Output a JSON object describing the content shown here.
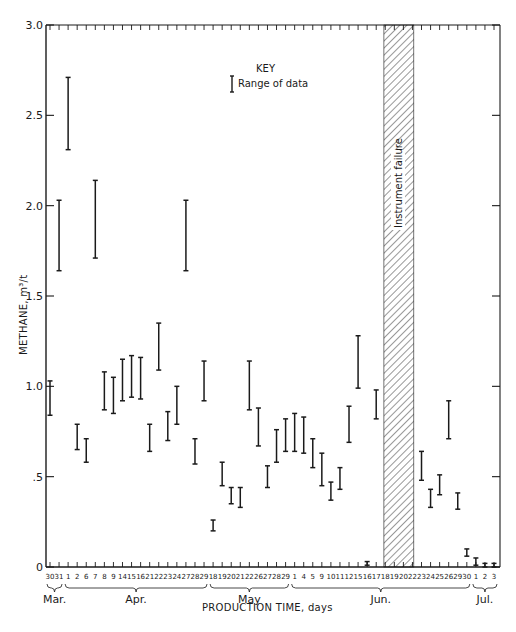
{
  "chart_data": {
    "type": "range-bar",
    "title": "",
    "xlabel": "PRODUCTION TIME, days",
    "ylabel": "METHANE, m3/t",
    "ylim": [
      0,
      3.0
    ],
    "yticks": [
      {
        "value": 0,
        "label": "0"
      },
      {
        "value": 0.5,
        "label": ".5"
      },
      {
        "value": 1.0,
        "label": "1.0"
      },
      {
        "value": 1.5,
        "label": "1.5"
      },
      {
        "value": 2.0,
        "label": "2.0"
      },
      {
        "value": 2.5,
        "label": "2.5"
      },
      {
        "value": 3.0,
        "label": "3.0"
      }
    ],
    "grid": false,
    "key": {
      "title": "KEY",
      "entry": "Range of data"
    },
    "annotation": "Instrument failure",
    "months": [
      {
        "label": "Mar.",
        "start": 0,
        "end": 1
      },
      {
        "label": "Apr.",
        "start": 2,
        "end": 17
      },
      {
        "label": "May",
        "start": 18,
        "end": 26
      },
      {
        "label": "Jun.",
        "start": 27,
        "end": 46
      },
      {
        "label": "Jul.",
        "start": 47,
        "end": 49
      }
    ],
    "instrument_failure_span": {
      "start_index": 37,
      "end_index": 40,
      "days": [
        "Jun 18",
        "Jun 19",
        "Jun 20",
        "Jun 22"
      ]
    },
    "categories": [
      "30",
      "31",
      "1",
      "2",
      "6",
      "7",
      "8",
      "9",
      "14",
      "15",
      "16",
      "21",
      "22",
      "23",
      "24",
      "27",
      "28",
      "29",
      "18",
      "19",
      "20",
      "21",
      "22",
      "26",
      "27",
      "28",
      "29",
      "1",
      "4",
      "5",
      "9",
      "10",
      "11",
      "12",
      "15",
      "16",
      "17",
      "18",
      "19",
      "20",
      "22",
      "23",
      "24",
      "25",
      "26",
      "29",
      "30",
      "1",
      "2",
      "3"
    ],
    "series": [
      {
        "name": "Range of data",
        "ranges": [
          {
            "date": "Mar 30",
            "low": 0.84,
            "high": 1.03
          },
          {
            "date": "Mar 31",
            "low": 1.64,
            "high": 2.03
          },
          {
            "date": "Apr 1",
            "low": 2.31,
            "high": 2.71
          },
          {
            "date": "Apr 2",
            "low": 0.65,
            "high": 0.79
          },
          {
            "date": "Apr 6",
            "low": 0.58,
            "high": 0.71
          },
          {
            "date": "Apr 7",
            "low": 1.71,
            "high": 2.14
          },
          {
            "date": "Apr 8",
            "low": 0.87,
            "high": 1.08
          },
          {
            "date": "Apr 9",
            "low": 0.85,
            "high": 1.05
          },
          {
            "date": "Apr 14",
            "low": 0.92,
            "high": 1.15
          },
          {
            "date": "Apr 15",
            "low": 0.94,
            "high": 1.17
          },
          {
            "date": "Apr 16",
            "low": 0.93,
            "high": 1.16
          },
          {
            "date": "Apr 21",
            "low": 0.64,
            "high": 0.79
          },
          {
            "date": "Apr 22",
            "low": 1.09,
            "high": 1.35
          },
          {
            "date": "Apr 23",
            "low": 0.7,
            "high": 0.86
          },
          {
            "date": "Apr 24",
            "low": 0.79,
            "high": 1.0
          },
          {
            "date": "Apr 27",
            "low": 1.64,
            "high": 2.03
          },
          {
            "date": "Apr 28",
            "low": 0.57,
            "high": 0.71
          },
          {
            "date": "Apr 29",
            "low": 0.92,
            "high": 1.14
          },
          {
            "date": "May 18",
            "low": 0.2,
            "high": 0.26
          },
          {
            "date": "May 19",
            "low": 0.45,
            "high": 0.58
          },
          {
            "date": "May 20",
            "low": 0.35,
            "high": 0.44
          },
          {
            "date": "May 21",
            "low": 0.33,
            "high": 0.44
          },
          {
            "date": "May 22",
            "low": 0.87,
            "high": 1.14
          },
          {
            "date": "May 26",
            "low": 0.67,
            "high": 0.88
          },
          {
            "date": "May 27",
            "low": 0.44,
            "high": 0.56
          },
          {
            "date": "May 28",
            "low": 0.58,
            "high": 0.76
          },
          {
            "date": "May 29",
            "low": 0.64,
            "high": 0.82
          },
          {
            "date": "Jun 1",
            "low": 0.64,
            "high": 0.85
          },
          {
            "date": "Jun 4",
            "low": 0.63,
            "high": 0.83
          },
          {
            "date": "Jun 5",
            "low": 0.55,
            "high": 0.71
          },
          {
            "date": "Jun 9",
            "low": 0.45,
            "high": 0.63
          },
          {
            "date": "Jun 10",
            "low": 0.37,
            "high": 0.47
          },
          {
            "date": "Jun 11",
            "low": 0.43,
            "high": 0.55
          },
          {
            "date": "Jun 12",
            "low": 0.69,
            "high": 0.89
          },
          {
            "date": "Jun 15",
            "low": 0.99,
            "high": 1.28
          },
          {
            "date": "Jun 16",
            "low": 0.01,
            "high": 0.03
          },
          {
            "date": "Jun 17",
            "low": 0.82,
            "high": 0.98
          },
          {
            "date": "Jun 18",
            "low": null,
            "high": null
          },
          {
            "date": "Jun 19",
            "low": null,
            "high": null
          },
          {
            "date": "Jun 20",
            "low": null,
            "high": null
          },
          {
            "date": "Jun 22",
            "low": null,
            "high": null
          },
          {
            "date": "Jun 23",
            "low": 0.48,
            "high": 0.64
          },
          {
            "date": "Jun 24",
            "low": 0.33,
            "high": 0.43
          },
          {
            "date": "Jun 25",
            "low": 0.4,
            "high": 0.51
          },
          {
            "date": "Jun 26",
            "low": 0.71,
            "high": 0.92
          },
          {
            "date": "Jun 29",
            "low": 0.32,
            "high": 0.41
          },
          {
            "date": "Jun 30",
            "low": 0.06,
            "high": 0.1
          },
          {
            "date": "Jul 1",
            "low": 0.01,
            "high": 0.05
          },
          {
            "date": "Jul 2",
            "low": 0.0,
            "high": 0.02
          },
          {
            "date": "Jul 3",
            "low": 0.0,
            "high": 0.02
          }
        ]
      }
    ],
    "colors": {
      "ink": "#1a1a1a",
      "background": "#ffffff"
    }
  },
  "labels": {
    "key_title": "KEY",
    "key_entry": "Range of data",
    "annotation": "Instrument failure",
    "xlabel": "PRODUCTION TIME, days",
    "ylabel": "METHANE,  m³/t"
  }
}
